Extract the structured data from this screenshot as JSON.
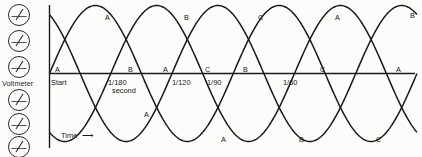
{
  "diagram": {
    "ink_color": "#1a1a1a",
    "background": "#fcfcfa"
  },
  "sidebar": {
    "label": "Voltmeter",
    "icon_name": "analog-meter-icon",
    "meters": [
      {
        "name": "meter-1"
      },
      {
        "name": "meter-2"
      },
      {
        "name": "meter-3"
      },
      {
        "name": "meter-4"
      },
      {
        "name": "meter-5"
      },
      {
        "name": "meter-6"
      }
    ]
  },
  "axis": {
    "x_label": "Time",
    "x_arrow": "⟶",
    "origin_label": "Start",
    "unit_label": "second"
  },
  "ticks": [
    {
      "text": "Start",
      "x": 51,
      "name": "tick-start"
    },
    {
      "text": "1/180",
      "x": 108,
      "name": "tick-1-180"
    },
    {
      "text": "1/120",
      "x": 172,
      "name": "tick-1-120"
    },
    {
      "text": "1/90",
      "x": 207,
      "name": "tick-1-90"
    },
    {
      "text": "1/60",
      "x": 283,
      "name": "tick-1-60"
    }
  ],
  "peak_labels": [
    {
      "text": "A",
      "x": 105,
      "y": 13
    },
    {
      "text": "B",
      "x": 184,
      "y": 13
    },
    {
      "text": "C",
      "x": 258,
      "y": 13
    },
    {
      "text": "A",
      "x": 335,
      "y": 13
    },
    {
      "text": "B",
      "x": 410,
      "y": 11
    }
  ],
  "axis_labels": [
    {
      "text": "A",
      "x": 55,
      "y": 65
    },
    {
      "text": "B",
      "x": 128,
      "y": 65
    },
    {
      "text": "A",
      "x": 163,
      "y": 65
    },
    {
      "text": "C",
      "x": 205,
      "y": 65
    },
    {
      "text": "B",
      "x": 243,
      "y": 65
    },
    {
      "text": "C",
      "x": 320,
      "y": 65
    },
    {
      "text": "A",
      "x": 396,
      "y": 65
    }
  ],
  "trough_labels": [
    {
      "text": "A",
      "x": 144,
      "y": 110
    },
    {
      "text": "A",
      "x": 221,
      "y": 135
    },
    {
      "text": "B",
      "x": 299,
      "y": 135
    },
    {
      "text": "C",
      "x": 376,
      "y": 135
    }
  ],
  "chart_data": {
    "type": "line",
    "xlabel": "Time",
    "ylabel": "",
    "grid": false,
    "legend": "inline-curve-labels",
    "xlim": [
      0,
      0.0167
    ],
    "ylim": [
      -1,
      1
    ],
    "x_tick_values": [
      0,
      0.00556,
      0.00833,
      0.01111,
      0.01667
    ],
    "x_tick_labels": [
      "Start",
      "1/180",
      "1/120",
      "1/90",
      "1/60"
    ],
    "series": [
      {
        "name": "A",
        "phase_deg": 0,
        "amplitude": 1,
        "cycles": 2
      },
      {
        "name": "B",
        "phase_deg": -120,
        "amplitude": 1,
        "cycles": 2
      },
      {
        "name": "C",
        "phase_deg": -240,
        "amplitude": 1,
        "cycles": 2
      }
    ]
  }
}
